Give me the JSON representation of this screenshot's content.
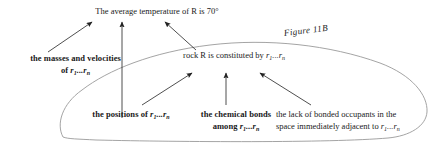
{
  "figure": {
    "label": "Figure 11B",
    "caption_style": "italic"
  },
  "nodes": {
    "top_claim": {
      "text": "The average temperature of R is 70°",
      "bold": false
    },
    "mid_claim": {
      "prefix": "rock R is constituted by ",
      "var_base": "r",
      "var_sub_first": "1",
      "var_ellipsis": "...",
      "var_sub_last": "n",
      "bold": false
    },
    "masses": {
      "line1": "the masses and velocities",
      "line2_prefix": "of ",
      "bold": true
    },
    "positions": {
      "line1_prefix": "the positions of ",
      "bold": true
    },
    "bonds": {
      "line1": "the chemical bonds",
      "line2_prefix": "among ",
      "bold": true
    },
    "lack": {
      "line1": "the lack of bonded occupants in the",
      "line2_prefix": "space immediately adjacent to ",
      "bold": false
    }
  },
  "variables": {
    "base": "r",
    "first_index": "1",
    "ellipsis": "...",
    "last_index": "n"
  },
  "colors": {
    "text": "#1a1a1a",
    "arrow": "#222222",
    "oval": "#9a9a9a",
    "background": "#ffffff"
  },
  "arrows": {
    "to_top_claim_count": 3,
    "to_mid_claim_count": 3
  }
}
